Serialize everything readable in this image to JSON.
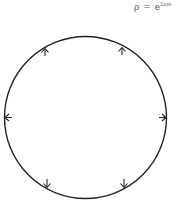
{
  "formula": {
    "lhs": "ρ",
    "eq": "=",
    "base": "e",
    "exponent": "2πiθ"
  },
  "diagram": {
    "shape": "circle",
    "center": [
      85.5,
      117.5
    ],
    "radius": 81,
    "stroke_color": "#222222",
    "arrows": [
      {
        "position": "upper-left",
        "direction": "up"
      },
      {
        "position": "upper-right",
        "direction": "up"
      },
      {
        "position": "left",
        "direction": "left"
      },
      {
        "position": "right",
        "direction": "right"
      },
      {
        "position": "lower-left",
        "direction": "down"
      },
      {
        "position": "lower-right",
        "direction": "down"
      }
    ]
  }
}
